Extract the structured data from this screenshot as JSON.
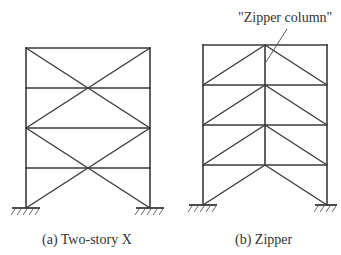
{
  "figure": {
    "panels": [
      {
        "id": "a",
        "caption": "(a) Two-story X",
        "frame": {
          "left": 26,
          "right": 150,
          "floors": [
            48,
            88,
            128,
            168,
            208
          ]
        },
        "bracing": "two-story X"
      },
      {
        "id": "b",
        "caption": "(b) Zipper",
        "frame": {
          "left": 203,
          "right": 327,
          "floors": [
            45,
            85,
            125,
            165,
            205
          ]
        },
        "bracing": "inverted-V chevrons with zipper column",
        "annotation": "\"Zipper column\""
      }
    ],
    "colors": {
      "line": "#3a3a3a",
      "text": "#333333",
      "background": "#ffffff"
    }
  }
}
